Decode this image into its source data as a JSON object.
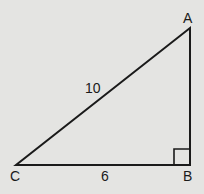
{
  "diagram": {
    "type": "right-triangle",
    "vertices": {
      "A": {
        "label": "A"
      },
      "B": {
        "label": "B"
      },
      "C": {
        "label": "C"
      }
    },
    "sides": {
      "hypotenuse_CA": {
        "label": "10"
      },
      "base_CB": {
        "label": "6"
      }
    },
    "right_angle_at": "B",
    "colors": {
      "background": "#e4e4e2",
      "stroke": "#1a1a1a"
    }
  }
}
